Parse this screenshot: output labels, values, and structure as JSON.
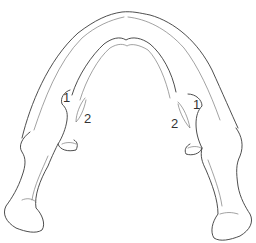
{
  "figure": {
    "stroke_color": "#3a3a3a",
    "background": "#ffffff"
  },
  "labels": {
    "left_1": "1",
    "left_2": "2",
    "right_1": "1",
    "right_2": "2"
  }
}
